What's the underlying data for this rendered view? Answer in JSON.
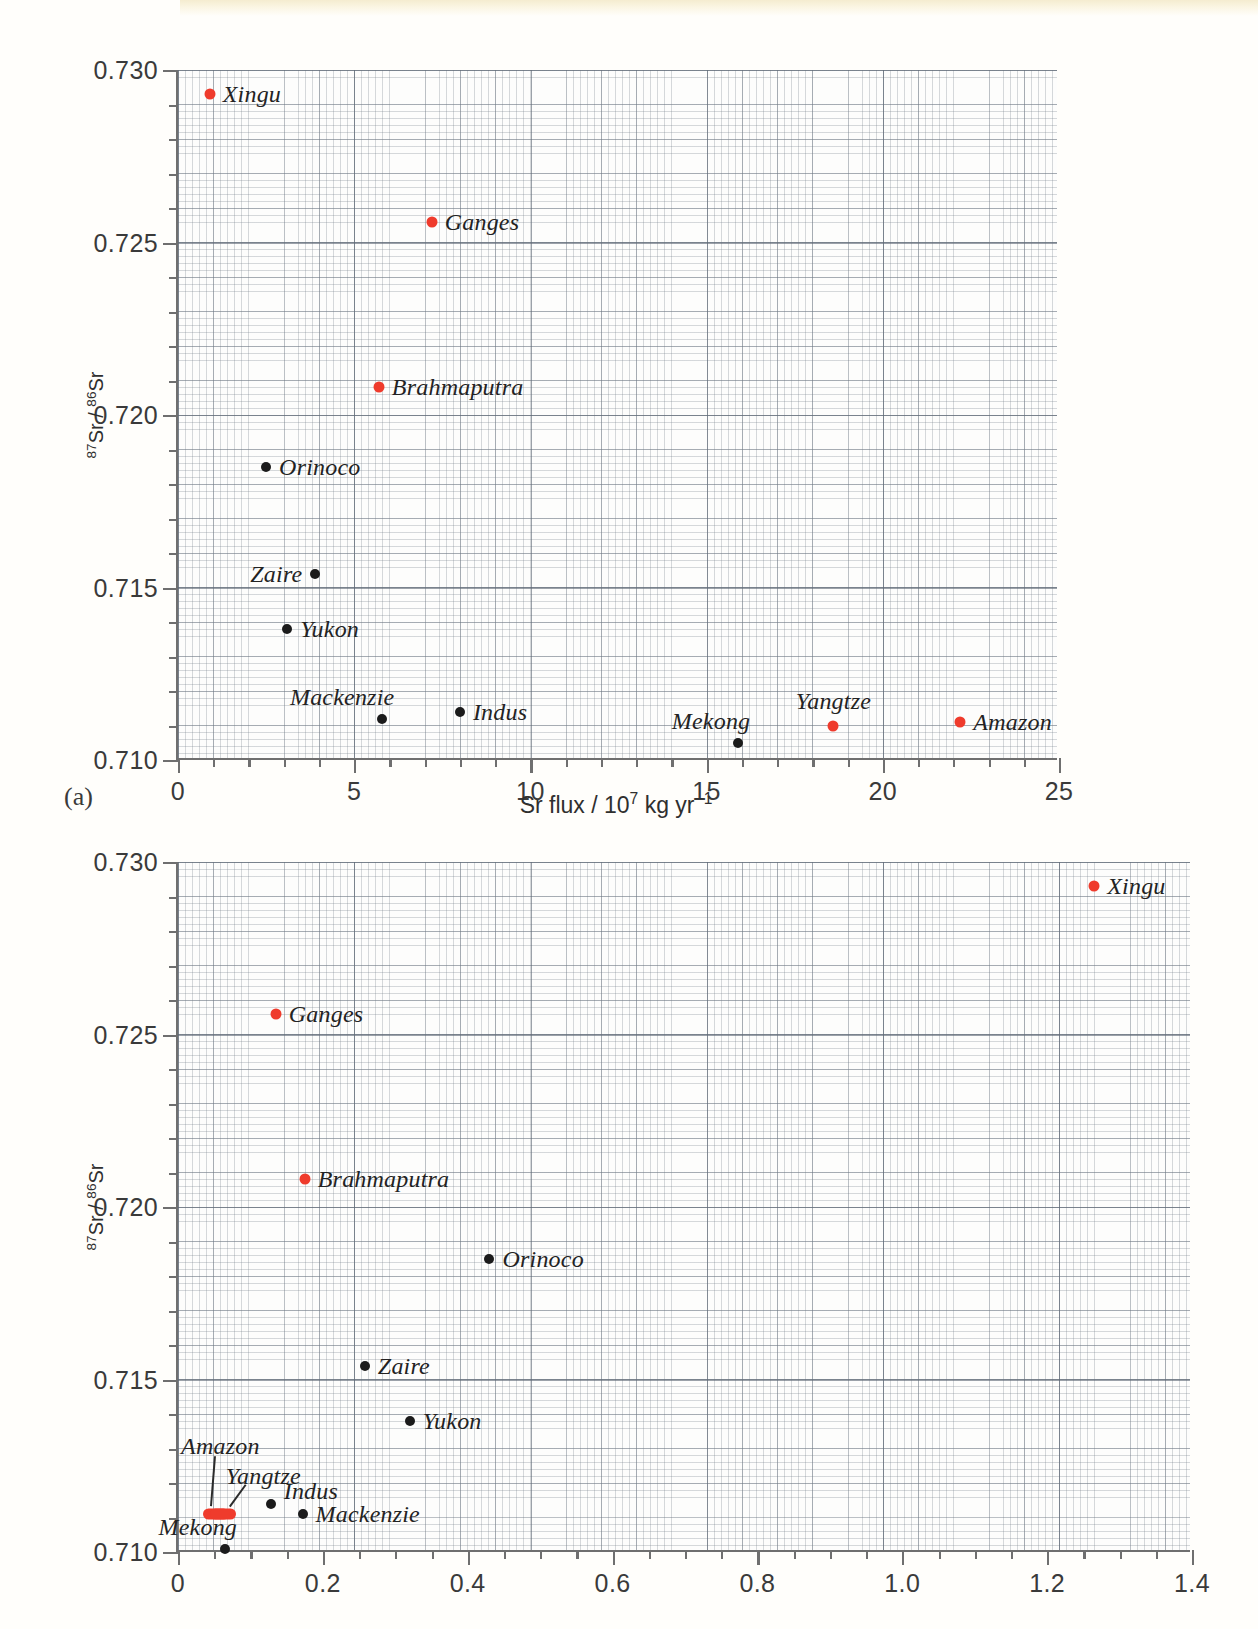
{
  "figure": {
    "ytitle_html": "<sup>87</sup>Sr / <sup>86</sup>Sr",
    "panel_a_tag": "(a)",
    "xtitle_a_html": "Sr flux / 10<sup>7</sup> kg yr<sup>−1</sup>",
    "colors": {
      "red": "#ef3b2c",
      "black": "#1b1b1b",
      "axis": "#6f6f6f"
    }
  },
  "chart_data": [
    {
      "id": "panel_a",
      "type": "scatter",
      "title": "",
      "panel_label": "(a)",
      "xlabel": "Sr flux / 10^7 kg yr^-1",
      "ylabel": "87Sr / 86Sr",
      "xlim": [
        0,
        25
      ],
      "ylim": [
        0.71,
        0.73
      ],
      "xticks": [
        0,
        5,
        10,
        15,
        20,
        25
      ],
      "xticklabels": [
        "0",
        "5",
        "10",
        "15",
        "20",
        "25"
      ],
      "yticks": [
        0.71,
        0.715,
        0.72,
        0.725,
        0.73
      ],
      "yticklabels": [
        "0.710",
        "0.715",
        "0.720",
        "0.725",
        "0.730"
      ],
      "x_minor_step": 1,
      "y_minor_step": 0.001,
      "grid": true,
      "legend": "none",
      "points": [
        {
          "name": "Xingu",
          "x": 0.9,
          "y": 0.7293,
          "color": "red",
          "label_side": "right"
        },
        {
          "name": "Ganges",
          "x": 7.2,
          "y": 0.7256,
          "color": "red",
          "label_side": "right"
        },
        {
          "name": "Brahmaputra",
          "x": 5.7,
          "y": 0.7208,
          "color": "red",
          "label_side": "right"
        },
        {
          "name": "Orinoco",
          "x": 2.5,
          "y": 0.7185,
          "color": "black",
          "label_side": "right"
        },
        {
          "name": "Zaire",
          "x": 3.9,
          "y": 0.7154,
          "color": "black",
          "label_side": "left"
        },
        {
          "name": "Yukon",
          "x": 3.1,
          "y": 0.7138,
          "color": "black",
          "label_side": "right"
        },
        {
          "name": "Mackenzie",
          "x": 5.8,
          "y": 0.7112,
          "color": "black",
          "label_side": "above-left"
        },
        {
          "name": "Indus",
          "x": 8.0,
          "y": 0.7114,
          "color": "black",
          "label_side": "right"
        },
        {
          "name": "Mekong",
          "x": 15.9,
          "y": 0.7105,
          "color": "black",
          "label_side": "above-left"
        },
        {
          "name": "Yangtze",
          "x": 18.6,
          "y": 0.711,
          "color": "red",
          "label_side": "above"
        },
        {
          "name": "Amazon",
          "x": 22.2,
          "y": 0.7111,
          "color": "red",
          "label_side": "right"
        }
      ]
    },
    {
      "id": "panel_b",
      "type": "scatter",
      "title": "",
      "panel_label": "",
      "xlabel": "",
      "ylabel": "87Sr / 86Sr",
      "xlim": [
        0,
        1.4
      ],
      "ylim": [
        0.71,
        0.73
      ],
      "xticks": [
        0,
        0.2,
        0.4,
        0.6,
        0.8,
        1.0,
        1.2,
        1.4
      ],
      "xticklabels": [
        "0",
        "0.2",
        "0.4",
        "0.6",
        "0.8",
        "1.0",
        "1.2",
        "1.4"
      ],
      "yticks": [
        0.71,
        0.715,
        0.72,
        0.725,
        0.73
      ],
      "yticklabels": [
        "0.710",
        "0.715",
        "0.720",
        "0.725",
        "0.730"
      ],
      "x_minor_step": 0.05,
      "y_minor_step": 0.001,
      "grid": true,
      "legend": "none",
      "points": [
        {
          "name": "Xingu",
          "x": 1.265,
          "y": 0.7293,
          "color": "red",
          "label_side": "right"
        },
        {
          "name": "Ganges",
          "x": 0.135,
          "y": 0.7256,
          "color": "red",
          "label_side": "right"
        },
        {
          "name": "Brahmaputra",
          "x": 0.175,
          "y": 0.7208,
          "color": "red",
          "label_side": "right"
        },
        {
          "name": "Orinoco",
          "x": 0.43,
          "y": 0.7185,
          "color": "black",
          "label_side": "right"
        },
        {
          "name": "Zaire",
          "x": 0.258,
          "y": 0.7154,
          "color": "black",
          "label_side": "right"
        },
        {
          "name": "Yukon",
          "x": 0.32,
          "y": 0.7138,
          "color": "black",
          "label_side": "right"
        },
        {
          "name": "Indus",
          "x": 0.128,
          "y": 0.7114,
          "color": "black",
          "label_side": "right-above"
        },
        {
          "name": "Mackenzie",
          "x": 0.172,
          "y": 0.7111,
          "color": "black",
          "label_side": "right"
        },
        {
          "name": "Amazon",
          "x": 0.052,
          "y": 0.7111,
          "color": "red",
          "label_side": "leader-upleft"
        },
        {
          "name": "Yangtze",
          "x": 0.062,
          "y": 0.7111,
          "color": "red",
          "label_side": "leader-up"
        },
        {
          "name": "Mekong",
          "x": 0.065,
          "y": 0.7101,
          "color": "black",
          "label_side": "above-left"
        }
      ]
    }
  ],
  "panel_a_labels": {
    "Xingu": "Xingu",
    "Ganges": "Ganges",
    "Brahmaputra": "Brahmaputra",
    "Orinoco": "Orinoco",
    "Zaire": "Zaire",
    "Yukon": "Yukon",
    "Mackenzie": "Mackenzie",
    "Indus": "Indus",
    "Mekong": "Mekong",
    "Yangtze": "Yangtze",
    "Amazon": "Amazon"
  },
  "panel_b_labels": {
    "Xingu": "Xingu",
    "Ganges": "Ganges",
    "Brahmaputra": "Brahmaputra",
    "Orinoco": "Orinoco",
    "Zaire": "Zaire",
    "Yukon": "Yukon",
    "Indus": "Indus",
    "Mackenzie": "Mackenzie",
    "Amazon": "Amazon",
    "Yangtze": "Yangtze",
    "Mekong": "Mekong"
  }
}
